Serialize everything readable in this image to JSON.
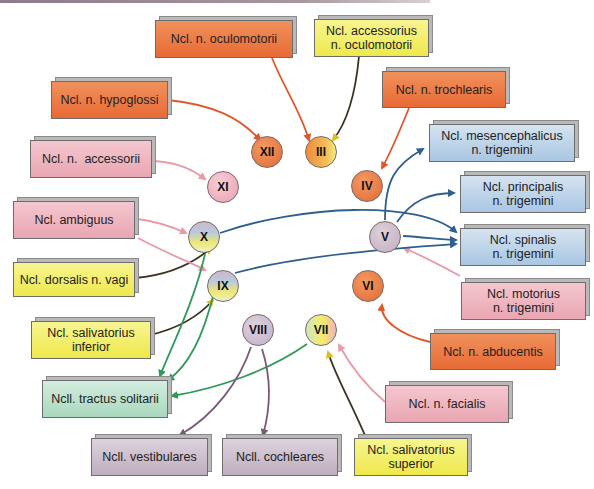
{
  "diagram": {
    "colors": {
      "somatomotor": "#e86a35",
      "visceromotor": "#efe84c",
      "branchiomotor": "#e9a6b2",
      "somatosensory": "#a9c6e2",
      "viscerosensory": "#a8d8bd",
      "special_sensory": "#bfaec0",
      "edge_orange": "#e0582a",
      "edge_yellow": "#c9b21a",
      "edge_pink": "#e79aa8",
      "edge_blue": "#2f5f8f",
      "edge_green": "#2f9a5a",
      "edge_purple": "#7a5878"
    },
    "nuclei": {
      "oculomotorii": "Ncl. n. oculomotorii",
      "accessorius_oculomotorii": "Ncl. accessorius n. oculomotorii",
      "hypoglossi": "Ncl. n. hypoglossi",
      "trochlearis": "Ncl. n. trochlearis",
      "accessorii": "Ncl. n.  accessorii",
      "mesencephalicus": "Ncl. mesencephalicus n. trigemini",
      "principalis": "Ncl. principalis n. trigemini",
      "ambiguus": "Ncl. ambiguus",
      "spinalis": "Ncl. spinalis n. trigemini",
      "dorsalis_vagi": "Ncl. dorsalis n. vagi",
      "motorius": "Ncl. motorius n. trigemini",
      "salivatorius_inferior": "Ncl. salivatorius inferior",
      "abducentis": "Ncl. n. abducentis",
      "tractus_solitarii": "Ncll. tractus solitarii",
      "facialis": "Ncl. n. facialis",
      "vestibulares": "Ncll. vestibulares",
      "cochleares": "Ncll. cochleares",
      "salivatorius_superior": "Ncl. salivatorius superior"
    },
    "nuclei_lines": {
      "accessorius_oculomotorii": [
        "Ncl. accessorius",
        "n. oculomotorii"
      ],
      "mesencephalicus": [
        "Ncl. mesencephalicus",
        "n. trigemini"
      ],
      "principalis": [
        "Ncl. principalis",
        "n. trigemini"
      ],
      "spinalis": [
        "Ncl. spinalis",
        "n. trigemini"
      ],
      "motorius": [
        "Ncl. motorius",
        "n. trigemini"
      ],
      "salivatorius_inferior": [
        "Ncl. salivatorius",
        "inferior"
      ],
      "salivatorius_superior": [
        "Ncl. salivatorius",
        "superior"
      ]
    },
    "nerves": {
      "III": "III",
      "IV": "IV",
      "V": "V",
      "VI": "VI",
      "VII": "VII",
      "VIII": "VIII",
      "IX": "IX",
      "X": "X",
      "XI": "XI",
      "XII": "XII"
    }
  }
}
